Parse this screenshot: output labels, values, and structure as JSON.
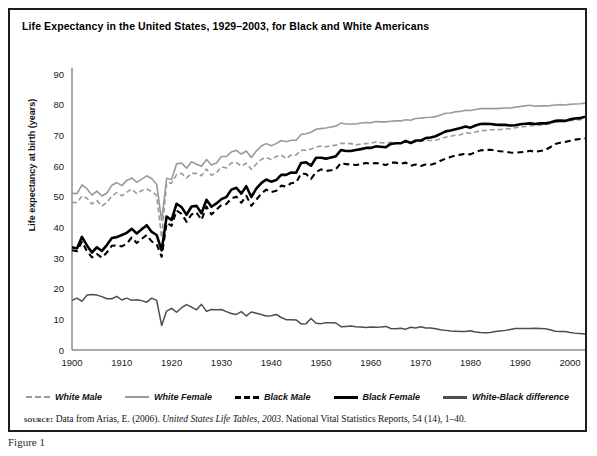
{
  "figure": {
    "title": "Life Expectancy in the United States, 1929–2003, for Black and White Americans",
    "caption": "Figure 1",
    "source": {
      "label": "source:",
      "text_before": " Data from Arias, E. (2006). ",
      "italic": "United States Life Tables, 2003",
      "text_after": ". National Vital Statistics Reports, 54 (14), 1–40."
    }
  },
  "legend": {
    "items": [
      {
        "key": "white_male",
        "label": "White Male",
        "style": "sw-wm",
        "color": "#9a9a9a"
      },
      {
        "key": "white_female",
        "label": "White Female",
        "style": "sw-wf",
        "color": "#9a9a9a"
      },
      {
        "key": "black_male",
        "label": "Black Male",
        "style": "sw-bm",
        "color": "#000000"
      },
      {
        "key": "black_female",
        "label": "Black Female",
        "style": "sw-bf",
        "color": "#000000"
      },
      {
        "key": "difference",
        "label": "White-Black difference",
        "style": "sw-diff",
        "color": "#4d4d4d"
      }
    ]
  },
  "chart_data": {
    "type": "line",
    "title": "Life Expectancy in the United States, 1929–2003, for Black and White Americans",
    "xlabel": "",
    "ylabel": "Life expectancy at birth (years)",
    "xlim": [
      1900,
      2003
    ],
    "ylim": [
      0,
      90
    ],
    "ytick_step": 10,
    "yticks": [
      0,
      10,
      20,
      30,
      40,
      50,
      60,
      70,
      80,
      90
    ],
    "xticks": [
      1900,
      1910,
      1920,
      1930,
      1940,
      1950,
      1960,
      1970,
      1980,
      1990,
      2000
    ],
    "grid": false,
    "legend_position": "below-axes",
    "x": [
      1900,
      1901,
      1902,
      1903,
      1904,
      1905,
      1906,
      1907,
      1908,
      1909,
      1910,
      1911,
      1912,
      1913,
      1914,
      1915,
      1916,
      1917,
      1918,
      1919,
      1920,
      1921,
      1922,
      1923,
      1924,
      1925,
      1926,
      1927,
      1928,
      1929,
      1930,
      1931,
      1932,
      1933,
      1934,
      1935,
      1936,
      1937,
      1938,
      1939,
      1940,
      1941,
      1942,
      1943,
      1944,
      1945,
      1946,
      1947,
      1948,
      1949,
      1950,
      1951,
      1952,
      1953,
      1954,
      1955,
      1956,
      1957,
      1958,
      1959,
      1960,
      1961,
      1962,
      1963,
      1964,
      1965,
      1966,
      1967,
      1968,
      1969,
      1970,
      1971,
      1972,
      1973,
      1974,
      1975,
      1976,
      1977,
      1978,
      1979,
      1980,
      1981,
      1982,
      1983,
      1984,
      1985,
      1986,
      1987,
      1988,
      1989,
      1990,
      1991,
      1992,
      1993,
      1994,
      1995,
      1996,
      1997,
      1998,
      1999,
      2000,
      2001,
      2002,
      2003
    ],
    "series": [
      {
        "name": "White Male",
        "color": "#9a9a9a",
        "dash": "5,3",
        "width": 1.6,
        "values": [
          48.2,
          48.0,
          50.2,
          49.5,
          47.6,
          48.7,
          46.9,
          48.1,
          50.2,
          51.3,
          50.3,
          51.5,
          52.5,
          51.0,
          52.0,
          52.5,
          51.7,
          50.4,
          36.6,
          54.5,
          54.4,
          57.2,
          57.6,
          56.1,
          57.6,
          57.6,
          56.8,
          59.0,
          57.0,
          57.8,
          59.7,
          59.4,
          61.0,
          61.1,
          60.0,
          60.9,
          58.9,
          60.6,
          62.1,
          62.8,
          62.1,
          63.1,
          63.6,
          62.4,
          63.6,
          63.6,
          65.1,
          65.2,
          65.5,
          66.2,
          66.5,
          66.3,
          66.6,
          66.8,
          67.4,
          67.3,
          67.3,
          66.9,
          67.2,
          67.3,
          67.4,
          67.8,
          67.6,
          67.5,
          67.7,
          67.6,
          67.6,
          67.8,
          67.5,
          67.8,
          68.0,
          68.3,
          68.3,
          68.4,
          68.9,
          69.4,
          69.7,
          70.0,
          70.2,
          70.8,
          70.7,
          71.1,
          71.5,
          71.6,
          71.8,
          71.8,
          71.9,
          72.1,
          72.2,
          72.5,
          72.7,
          72.9,
          73.2,
          73.1,
          73.3,
          73.4,
          73.8,
          74.3,
          74.5,
          74.6,
          74.8,
          75.0,
          75.1,
          75.3
        ]
      },
      {
        "name": "White Female",
        "color": "#9a9a9a",
        "dash": "",
        "width": 1.6,
        "values": [
          51.1,
          51.0,
          53.8,
          52.6,
          50.5,
          51.8,
          50.2,
          51.2,
          53.7,
          54.6,
          53.6,
          55.3,
          56.1,
          54.7,
          55.7,
          56.8,
          55.9,
          54.0,
          42.2,
          56.0,
          55.6,
          60.7,
          61.0,
          59.3,
          61.4,
          60.6,
          59.9,
          62.1,
          60.3,
          61.0,
          63.1,
          63.1,
          64.6,
          65.1,
          63.9,
          64.9,
          62.8,
          64.9,
          66.5,
          67.3,
          66.6,
          67.3,
          68.3,
          67.9,
          68.4,
          68.4,
          70.3,
          70.5,
          71.0,
          72.0,
          72.2,
          72.4,
          72.7,
          73.0,
          74.0,
          73.7,
          73.7,
          73.7,
          74.0,
          74.2,
          74.1,
          74.5,
          74.4,
          74.4,
          74.6,
          74.7,
          74.7,
          75.1,
          74.9,
          75.5,
          75.6,
          75.8,
          75.9,
          76.1,
          76.6,
          77.2,
          77.3,
          77.7,
          77.8,
          78.2,
          78.1,
          78.4,
          78.7,
          78.7,
          78.7,
          78.7,
          78.8,
          78.9,
          78.9,
          79.2,
          79.4,
          79.6,
          79.8,
          79.5,
          79.6,
          79.6,
          79.7,
          79.9,
          80.0,
          79.9,
          80.1,
          80.2,
          80.3,
          80.5
        ]
      },
      {
        "name": "Black Male",
        "color": "#000000",
        "dash": "6,4",
        "width": 2.1,
        "values": [
          32.5,
          32.2,
          35.3,
          32.2,
          30.2,
          31.3,
          30.1,
          31.8,
          34.0,
          34.1,
          33.8,
          34.7,
          36.7,
          34.9,
          36.2,
          37.5,
          35.4,
          34.5,
          30.4,
          41.5,
          40.5,
          45.5,
          44.4,
          41.8,
          44.2,
          44.9,
          42.4,
          46.8,
          44.2,
          45.7,
          47.3,
          47.6,
          49.4,
          50.0,
          48.0,
          50.3,
          47.0,
          49.0,
          51.0,
          52.3,
          51.5,
          51.9,
          53.6,
          53.3,
          54.4,
          54.6,
          57.5,
          57.4,
          55.8,
          58.0,
          58.9,
          58.4,
          58.6,
          59.0,
          61.0,
          60.6,
          60.5,
          60.3,
          60.6,
          61.0,
          60.7,
          61.0,
          60.7,
          60.3,
          61.1,
          61.1,
          60.7,
          61.1,
          60.1,
          60.5,
          60.0,
          60.5,
          60.4,
          60.9,
          61.7,
          62.4,
          62.9,
          63.4,
          63.7,
          64.0,
          63.8,
          64.5,
          65.1,
          65.2,
          65.3,
          65.0,
          64.8,
          64.7,
          64.4,
          64.3,
          64.5,
          64.6,
          65.0,
          64.6,
          64.9,
          65.2,
          66.1,
          67.2,
          67.6,
          67.8,
          68.2,
          68.6,
          68.8,
          69.0
        ]
      },
      {
        "name": "Black Female",
        "color": "#000000",
        "dash": "",
        "width": 2.6,
        "values": [
          33.5,
          33.1,
          36.9,
          34.1,
          31.8,
          33.5,
          32.3,
          34.2,
          36.5,
          36.8,
          37.5,
          38.2,
          39.5,
          38.0,
          39.4,
          40.7,
          38.5,
          37.5,
          32.5,
          43.5,
          42.4,
          47.7,
          46.6,
          44.1,
          46.8,
          47.0,
          44.6,
          49.0,
          46.7,
          47.8,
          49.2,
          49.9,
          52.3,
          52.9,
          51.0,
          53.4,
          49.9,
          52.6,
          54.4,
          55.6,
          54.9,
          55.4,
          57.1,
          57.1,
          57.9,
          57.8,
          61.0,
          61.2,
          60.1,
          62.7,
          62.7,
          62.4,
          62.8,
          63.2,
          65.2,
          64.9,
          64.9,
          65.2,
          65.5,
          65.9,
          65.9,
          66.4,
          66.3,
          66.1,
          67.2,
          67.4,
          67.4,
          68.2,
          67.5,
          68.3,
          68.3,
          69.1,
          69.3,
          69.7,
          70.5,
          71.3,
          71.6,
          72.0,
          72.4,
          72.9,
          72.5,
          73.2,
          73.7,
          73.8,
          73.7,
          73.5,
          73.4,
          73.4,
          73.2,
          73.3,
          73.6,
          73.8,
          73.9,
          73.7,
          73.9,
          73.9,
          74.2,
          74.7,
          74.8,
          74.7,
          75.2,
          75.5,
          75.6,
          76.1
        ]
      },
      {
        "name": "White-Black difference",
        "color": "#4d4d4d",
        "dash": "",
        "width": 1.5,
        "values": [
          16.2,
          16.9,
          15.9,
          17.9,
          18.1,
          17.9,
          17.4,
          16.7,
          16.7,
          17.5,
          16.3,
          16.9,
          16.2,
          16.4,
          16.1,
          15.6,
          16.9,
          16.2,
          8.0,
          12.7,
          13.6,
          12.3,
          13.8,
          14.8,
          14.0,
          13.1,
          14.9,
          12.6,
          13.2,
          13.1,
          13.2,
          12.5,
          11.9,
          11.6,
          12.5,
          11.1,
          12.4,
          12.0,
          11.6,
          11.1,
          11.2,
          11.6,
          10.6,
          9.9,
          9.9,
          9.8,
          8.5,
          8.6,
          10.3,
          8.7,
          8.6,
          8.9,
          8.9,
          8.8,
          7.6,
          7.7,
          7.8,
          7.6,
          7.5,
          7.3,
          7.5,
          7.4,
          7.5,
          7.7,
          7.0,
          6.9,
          7.1,
          6.8,
          7.4,
          7.2,
          7.6,
          7.2,
          7.2,
          6.9,
          6.6,
          6.4,
          6.2,
          6.1,
          6.0,
          6.0,
          6.3,
          5.9,
          5.7,
          5.6,
          5.7,
          6.0,
          6.2,
          6.4,
          6.7,
          7.0,
          7.0,
          7.0,
          7.0,
          7.1,
          7.0,
          6.9,
          6.6,
          6.1,
          6.0,
          6.0,
          5.7,
          5.5,
          5.4,
          5.2
        ]
      }
    ]
  }
}
